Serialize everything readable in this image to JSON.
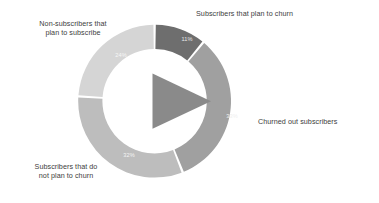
{
  "chart_data": {
    "type": "pie",
    "variant": "donut",
    "title": "",
    "subtitle": "",
    "xlabel": "",
    "ylabel": "",
    "legend_position": "none",
    "grid": false,
    "center_icon": "play-triangle-icon",
    "start_angle_deg": 0,
    "direction": "clockwise",
    "categories": [
      "Subscribers that plan to churn",
      "Churned out subscribers",
      "Subscribers that do not plan to churn",
      "Non-subscribers that plan to subscribe"
    ],
    "values": [
      11,
      33,
      32,
      24
    ],
    "value_labels": [
      "11%",
      "33%",
      "32%",
      "24%"
    ],
    "colors": [
      "#6e6e6e",
      "#a0a0a0",
      "#bdbdbd",
      "#d5d5d5"
    ],
    "total": 100,
    "units": "percent"
  },
  "colors": {
    "background": "#ffffff",
    "center_icon": "#8a8a8a",
    "label_text": "#3d3d3d",
    "value_text": "#f2f2f2",
    "slice_gap": "#ffffff",
    "slice_plan_to_churn": "#6e6e6e",
    "slice_churned_out": "#a0a0a0",
    "slice_not_plan_to_churn": "#bdbdbd",
    "slice_non_subscribers": "#d5d5d5"
  },
  "callouts": {
    "non_subscribers": "Non-subscribers that\nplan to subscribe",
    "plan_to_churn": "Subscribers that plan to churn",
    "churned_out": "Churned out subscribers",
    "not_plan_to_churn": "Subscribers that do\nnot plan to churn"
  },
  "value_labels": {
    "plan_to_churn": "11%",
    "churned_out": "33%",
    "not_plan_to_churn": "32%",
    "non_subscribers": "24%"
  }
}
